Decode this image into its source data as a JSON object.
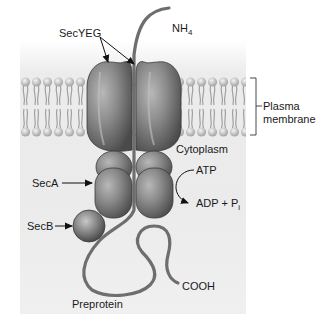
{
  "diagram": {
    "labels": {
      "secyeg": "SecYEG",
      "nh4": "NH",
      "nh4_sub": "4",
      "plasma_membrane_line1": "Plasma",
      "plasma_membrane_line2": "membrane",
      "cytoplasm": "Cytoplasm",
      "atp": "ATP",
      "adp": "ADP + P",
      "adp_sub": "i",
      "seca": "SecA",
      "secb": "SecB",
      "cooh": "COOH",
      "preprotein": "Preprotein"
    },
    "colors": {
      "background": "#ffffff",
      "panel": "#ececec",
      "protein_dark": "#5a5a5a",
      "protein_mid": "#8a8a8a",
      "protein_light": "#b4b4b4",
      "membrane_head": "#d0d0d0",
      "chain": "#6e6e6e",
      "text": "#1a1a1a"
    }
  }
}
